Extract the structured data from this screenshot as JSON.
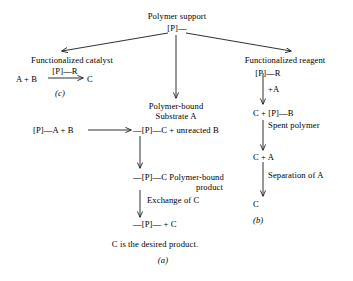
{
  "diagram": {
    "title": "Polymer support",
    "root_symbol": "[P]—",
    "branches": {
      "left": {
        "heading": "Functionalized catalyst",
        "reaction_left": "A + B",
        "reaction_above_arrow": "[P]—R",
        "reaction_right": "C",
        "caption": "(c)"
      },
      "middle": {
        "node1_line1": "Polymer-bound",
        "node1_line2": "Substrate A",
        "row_left": "[P]—A + B",
        "row_right": "—[P]—C + unreacted B",
        "node2_line1": "—[P]—C Polymer-bound",
        "node2_line2": "product",
        "step_label": "Exchange of C",
        "node3": "—[P]— + C",
        "conclusion": "C is the desired product.",
        "caption": "(a)"
      },
      "right": {
        "heading": "Functionalized reagent",
        "node1": "[P]—R",
        "step1_label": "+A",
        "node2": "C + [P]—B",
        "node2_note": "Spent polymer",
        "node3": "C + A",
        "step2_label": "Separation of A",
        "node4": "C",
        "caption": "(b)"
      }
    },
    "colors": {
      "ink": "#1a1a1a",
      "background": "#ffffff"
    }
  }
}
